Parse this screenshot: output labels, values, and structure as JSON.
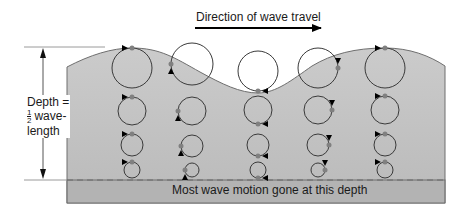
{
  "figure": {
    "direction_label": "Direction of wave travel",
    "depth_label": {
      "line1": "Depth =",
      "fraction_num": "1",
      "fraction_den": "2",
      "line2": "wave-",
      "line3": "length"
    },
    "bottom_label": "Most wave motion gone at this depth",
    "colors": {
      "water_top": "#c9c9c9",
      "water_bottom": "#b9b9b9",
      "deep_zone": "#b0b0b0",
      "outline": "#6e6e6e",
      "circle_stroke": "#3a3a3a",
      "particle": "#808080",
      "arrowhead": "#000000"
    },
    "columns": [
      {
        "x": 132,
        "circles": [
          {
            "y": 68,
            "r": 20
          },
          {
            "y": 111,
            "r": 14
          },
          {
            "y": 145,
            "r": 11
          },
          {
            "y": 170,
            "r": 8
          }
        ],
        "particle_angle_deg": -90,
        "arrow_side": "left-top"
      },
      {
        "x": 192,
        "circles": [
          {
            "y": 64,
            "r": 21
          },
          {
            "y": 111,
            "r": 14
          },
          {
            "y": 146,
            "r": 11
          },
          {
            "y": 170,
            "r": 7
          }
        ],
        "particle_angle_deg": 180,
        "arrow_side": "left"
      },
      {
        "x": 258,
        "circles": [
          {
            "y": 71,
            "r": 20
          },
          {
            "y": 110,
            "r": 14
          },
          {
            "y": 145,
            "r": 11
          },
          {
            "y": 170,
            "r": 8
          }
        ],
        "particle_angle_deg": 90,
        "arrow_side": "bottom-right"
      },
      {
        "x": 318,
        "circles": [
          {
            "y": 68,
            "r": 20
          },
          {
            "y": 110,
            "r": 14
          },
          {
            "y": 145,
            "r": 11
          },
          {
            "y": 170,
            "r": 7
          }
        ],
        "particle_angle_deg": 0,
        "arrow_side": "top-right"
      },
      {
        "x": 385,
        "circles": [
          {
            "y": 68,
            "r": 20
          },
          {
            "y": 110,
            "r": 14
          },
          {
            "y": 145,
            "r": 11
          },
          {
            "y": 170,
            "r": 8
          }
        ],
        "particle_angle_deg": -90,
        "arrow_side": "left-top"
      }
    ]
  }
}
